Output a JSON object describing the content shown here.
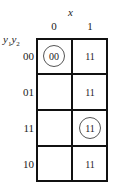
{
  "kmap": {
    "column_variable": "x",
    "row_variables": {
      "base": "y",
      "sub1": "1",
      "sub2": "2"
    },
    "columns": [
      "0",
      "1"
    ],
    "rows": [
      "00",
      "01",
      "11",
      "10"
    ],
    "cells": [
      [
        {
          "value": "00",
          "circled": true
        },
        {
          "value": "11",
          "circled": false
        }
      ],
      [
        {
          "value": "",
          "circled": false
        },
        {
          "value": "11",
          "circled": false
        }
      ],
      [
        {
          "value": "",
          "circled": false
        },
        {
          "value": "11",
          "circled": true
        }
      ],
      [
        {
          "value": "",
          "circled": false
        },
        {
          "value": "11",
          "circled": false
        }
      ]
    ]
  }
}
